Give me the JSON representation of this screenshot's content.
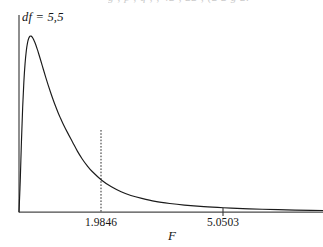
{
  "figure": {
    "clipped_header_text": "g        ,   p   ,  q   ,  ,  42 ,       22  ,  (2 2  g  2.",
    "annotation": "df = 5,5",
    "axis_label_x": "F"
  },
  "chart_data": {
    "type": "line",
    "title": "",
    "subtitle": "",
    "xlabel": "F",
    "ylabel": "",
    "annotations": [
      {
        "text": "df = 5,5",
        "x_px": 22,
        "y_px": 10,
        "style": "italic"
      }
    ],
    "legend": null,
    "legend_position": "none",
    "grid": false,
    "distribution": "F-distribution density",
    "df1": 5,
    "df2": 5,
    "xlim": [
      0,
      12.5
    ],
    "ylim": [
      0,
      0.72
    ],
    "ticks": [
      {
        "label": "1.9846",
        "value": 1.9846,
        "x_px": 101,
        "marker": "dotted-vertical-line",
        "line_top_px": 130,
        "line_bottom_px": 212
      },
      {
        "label": "5.0503",
        "value": 5.0503,
        "x_px": 223,
        "marker": "tick",
        "tick_half_len_px": 4
      }
    ],
    "axes": {
      "x_axis_y_px": 212,
      "y_axis_x_px": 19,
      "y_axis_top_px": 15,
      "x_axis_right_px": 323
    },
    "x": [
      0.0,
      0.05,
      0.1,
      0.15,
      0.2,
      0.25,
      0.3,
      0.35,
      0.4,
      0.45,
      0.5,
      0.55,
      0.6,
      0.65,
      0.7,
      0.75,
      0.8,
      0.9,
      1.0,
      1.1,
      1.2,
      1.3,
      1.4,
      1.5,
      1.6,
      1.7,
      1.8,
      1.9846,
      2.2,
      2.4,
      2.6,
      2.8,
      3.0,
      3.4,
      3.8,
      4.2,
      4.6,
      5.0503,
      5.6,
      6.2,
      6.8,
      7.6,
      8.4,
      9.2,
      10.0,
      11.0,
      12.0,
      12.5
    ],
    "y": [
      0.0,
      0.1115,
      0.2562,
      0.3807,
      0.4755,
      0.5432,
      0.5891,
      0.6182,
      0.6348,
      0.6422,
      0.6428,
      0.6385,
      0.6307,
      0.6204,
      0.6084,
      0.5952,
      0.5812,
      0.5518,
      0.5217,
      0.4922,
      0.4637,
      0.4366,
      0.4111,
      0.3872,
      0.3648,
      0.344,
      0.3247,
      0.2919,
      0.2559,
      0.2224,
      0.1939,
      0.1696,
      0.1489,
      0.1163,
      0.0922,
      0.0742,
      0.0605,
      0.0497,
      0.039,
      0.0311,
      0.0252,
      0.0195,
      0.0154,
      0.0123,
      0.01,
      0.0077,
      0.006,
      0.0054
    ],
    "series": [
      {
        "name": "F density (df = 5,5)",
        "color": "#1b1b1b",
        "style": "solid",
        "values": [
          0.0,
          0.1115,
          0.2562,
          0.3807,
          0.4755,
          0.5432,
          0.5891,
          0.6182,
          0.6348,
          0.6422,
          0.6428,
          0.6385,
          0.6307,
          0.6204,
          0.6084,
          0.5952,
          0.5812,
          0.5518,
          0.5217,
          0.4922,
          0.4637,
          0.4366,
          0.4111,
          0.3872,
          0.3648,
          0.344,
          0.3247,
          0.2919,
          0.2559,
          0.2224,
          0.1939,
          0.1696,
          0.1489,
          0.1163,
          0.0922,
          0.0742,
          0.0605,
          0.0497,
          0.039,
          0.0311,
          0.0252,
          0.0195,
          0.0154,
          0.0123,
          0.01,
          0.0077,
          0.006,
          0.0054
        ]
      }
    ]
  }
}
